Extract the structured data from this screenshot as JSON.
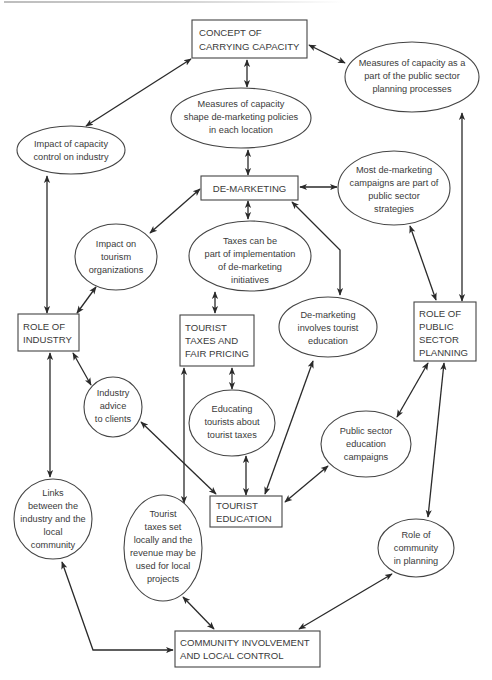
{
  "diagram": {
    "type": "concept-map",
    "colors": {
      "stroke": "#444444",
      "edge": "#2a2a2a",
      "text": "#3a3a3a",
      "background": "#ffffff"
    },
    "nodes": {
      "concept_capacity": {
        "shape": "box",
        "lines": [
          "CONCEPT OF",
          "CARRYING CAPACITY"
        ]
      },
      "measures_public": {
        "shape": "ellipse",
        "lines": [
          "Measures of capacity as a",
          "part of the public sector",
          "planning processes"
        ]
      },
      "measures_shape": {
        "shape": "ellipse",
        "lines": [
          "Measures of capacity",
          "shape de-marketing policies",
          "in each location"
        ]
      },
      "impact_capacity": {
        "shape": "ellipse",
        "lines": [
          "Impact of capacity",
          "control on industry"
        ]
      },
      "de_marketing": {
        "shape": "box",
        "lines": [
          "DE-MARKETING"
        ]
      },
      "most_campaigns": {
        "shape": "ellipse",
        "lines": [
          "Most de-marketing",
          "campaigns are part of",
          "public sector",
          "strategies"
        ]
      },
      "impact_tourism": {
        "shape": "ellipse",
        "lines": [
          "Impact on",
          "tourism",
          "organizations"
        ]
      },
      "taxes_part": {
        "shape": "ellipse",
        "lines": [
          "Taxes can be",
          "part of implementation",
          "of de-marketing",
          "initiatives"
        ]
      },
      "role_industry": {
        "shape": "box",
        "lines": [
          "ROLE OF",
          "INDUSTRY"
        ]
      },
      "tourist_taxes": {
        "shape": "box",
        "lines": [
          "TOURIST",
          "TAXES AND",
          "FAIR PRICING"
        ]
      },
      "demarketing_education": {
        "shape": "ellipse",
        "lines": [
          "De-marketing",
          "involves tourist",
          "education"
        ]
      },
      "role_public": {
        "shape": "box",
        "lines": [
          "ROLE OF",
          "PUBLIC",
          "SECTOR",
          "PLANNING"
        ]
      },
      "industry_advice": {
        "shape": "ellipse",
        "lines": [
          "Industry",
          "advice",
          "to clients"
        ]
      },
      "educating_tourists": {
        "shape": "ellipse",
        "lines": [
          "Educating",
          "tourists about",
          "tourist taxes"
        ]
      },
      "public_education": {
        "shape": "ellipse",
        "lines": [
          "Public sector",
          "education",
          "campaigns"
        ]
      },
      "tourist_education": {
        "shape": "box",
        "lines": [
          "TOURIST",
          "EDUCATION"
        ]
      },
      "links_industry": {
        "shape": "ellipse",
        "lines": [
          "Links",
          "between the",
          "industry and the",
          "local",
          "community"
        ]
      },
      "taxes_locally": {
        "shape": "ellipse",
        "lines": [
          "Tourist",
          "taxes set",
          "locally and the",
          "revenue may be",
          "used for local",
          "projects"
        ]
      },
      "role_community": {
        "shape": "ellipse",
        "lines": [
          "Role of",
          "community",
          "in planning"
        ]
      },
      "community_involvement": {
        "shape": "box",
        "lines": [
          "COMMUNITY INVOLVEMENT",
          "AND LOCAL CONTROL"
        ]
      }
    },
    "edges": [
      {
        "from": "concept_capacity",
        "to": "impact_capacity",
        "direction": "both"
      },
      {
        "from": "concept_capacity",
        "to": "measures_shape",
        "direction": "both"
      },
      {
        "from": "concept_capacity",
        "to": "measures_public",
        "direction": "both"
      },
      {
        "from": "measures_shape",
        "to": "de_marketing",
        "direction": "both"
      },
      {
        "from": "impact_capacity",
        "to": "role_industry",
        "direction": "both"
      },
      {
        "from": "measures_public",
        "to": "role_public",
        "direction": "both"
      },
      {
        "from": "de_marketing",
        "to": "most_campaigns",
        "direction": "both"
      },
      {
        "from": "de_marketing",
        "to": "impact_tourism",
        "direction": "both"
      },
      {
        "from": "de_marketing",
        "to": "taxes_part",
        "direction": "both"
      },
      {
        "from": "de_marketing",
        "to": "demarketing_education",
        "direction": "both"
      },
      {
        "from": "most_campaigns",
        "to": "role_public",
        "direction": "both"
      },
      {
        "from": "impact_tourism",
        "to": "role_industry",
        "direction": "both"
      },
      {
        "from": "taxes_part",
        "to": "tourist_taxes",
        "direction": "both"
      },
      {
        "from": "role_industry",
        "to": "industry_advice",
        "direction": "both"
      },
      {
        "from": "role_industry",
        "to": "links_industry",
        "direction": "both"
      },
      {
        "from": "tourist_taxes",
        "to": "educating_tourists",
        "direction": "both"
      },
      {
        "from": "tourist_taxes",
        "to": "taxes_locally",
        "direction": "both"
      },
      {
        "from": "educating_tourists",
        "to": "tourist_education",
        "direction": "both"
      },
      {
        "from": "industry_advice",
        "to": "tourist_education",
        "direction": "both"
      },
      {
        "from": "demarketing_education",
        "to": "tourist_education",
        "direction": "both"
      },
      {
        "from": "public_education",
        "to": "tourist_education",
        "direction": "both"
      },
      {
        "from": "role_public",
        "to": "public_education",
        "direction": "both"
      },
      {
        "from": "role_public",
        "to": "role_community",
        "direction": "both"
      },
      {
        "from": "links_industry",
        "to": "community_involvement",
        "direction": "both"
      },
      {
        "from": "taxes_locally",
        "to": "community_involvement",
        "direction": "both"
      },
      {
        "from": "role_community",
        "to": "community_involvement",
        "direction": "both"
      }
    ]
  }
}
